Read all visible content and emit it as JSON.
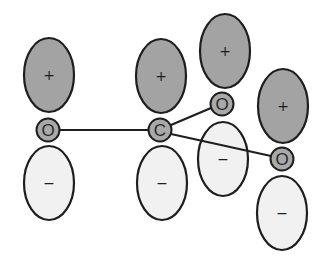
{
  "diagram": {
    "title": "",
    "colors": {
      "positive_lobe": "#a3a3a3",
      "negative_lobe": "#f1f1f1",
      "atom": "#a9a9a9",
      "outline": "#1e1e1e"
    },
    "atoms": [
      {
        "id": "o_left",
        "label": "O",
        "cx": 48,
        "cy": 130,
        "r": 11.5
      },
      {
        "id": "c_center",
        "label": "C",
        "cx": 160,
        "cy": 130,
        "r": 11.5
      },
      {
        "id": "o_upper",
        "label": "O",
        "cx": 222,
        "cy": 104,
        "r": 11.5
      },
      {
        "id": "o_lower",
        "label": "O",
        "cx": 282,
        "cy": 159,
        "r": 11.5
      }
    ],
    "bonds": [
      {
        "from": "o_left",
        "to": "c_center"
      },
      {
        "from": "c_center",
        "to": "o_upper"
      },
      {
        "from": "c_center",
        "to": "o_lower"
      }
    ],
    "lobes": [
      {
        "atom": "o_left",
        "sign": "+",
        "phase": "positive",
        "cx": 49,
        "cy": 75,
        "rx": 25,
        "ry": 37
      },
      {
        "atom": "o_left",
        "sign": "−",
        "phase": "negative",
        "cx": 49,
        "cy": 183,
        "rx": 25,
        "ry": 37
      },
      {
        "atom": "c_center",
        "sign": "+",
        "phase": "positive",
        "cx": 161,
        "cy": 76,
        "rx": 25,
        "ry": 37
      },
      {
        "atom": "c_center",
        "sign": "−",
        "phase": "negative",
        "cx": 162,
        "cy": 183,
        "rx": 25,
        "ry": 37
      },
      {
        "atom": "o_upper",
        "sign": "+",
        "phase": "positive",
        "cx": 225,
        "cy": 51,
        "rx": 25,
        "ry": 37
      },
      {
        "atom": "o_upper",
        "sign": "−",
        "phase": "negative",
        "cx": 223,
        "cy": 159,
        "rx": 25,
        "ry": 37
      },
      {
        "atom": "o_lower",
        "sign": "+",
        "phase": "positive",
        "cx": 283,
        "cy": 106,
        "rx": 25,
        "ry": 37
      },
      {
        "atom": "o_lower",
        "sign": "−",
        "phase": "negative",
        "cx": 282,
        "cy": 213,
        "rx": 25,
        "ry": 37
      }
    ]
  }
}
